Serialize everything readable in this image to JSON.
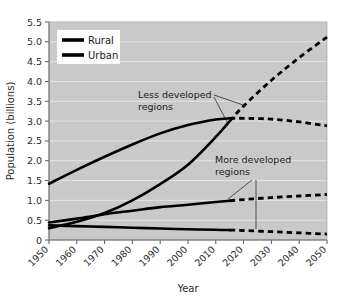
{
  "chart_data": {
    "type": "line",
    "title": "",
    "xlabel": "Year",
    "ylabel": "Population (billions)",
    "xlim": [
      1950,
      2050
    ],
    "ylim": [
      0,
      5.5
    ],
    "grid": true,
    "legend_position": "top-left",
    "x_ticks": [
      "1950",
      "1960",
      "1970",
      "1980",
      "1990",
      "2000",
      "2010",
      "2020",
      "2030",
      "2040",
      "2050"
    ],
    "y_ticks": [
      "0",
      "0.5",
      "1.0",
      "1.5",
      "2.0",
      "2.5",
      "3.0",
      "3.5",
      "4.0",
      "4.5",
      "5.0",
      "5.5"
    ],
    "legend": [
      {
        "label": "Rural",
        "style": "solid",
        "color": "#000000"
      },
      {
        "label": "Urban",
        "style": "solid",
        "color": "#000000"
      }
    ],
    "annotations": [
      {
        "id": "less-developed",
        "text_line1": "Less developed",
        "text_line2": "regions"
      },
      {
        "id": "more-developed",
        "text_line1": "More developed",
        "text_line2": "regions"
      }
    ],
    "projection_start_year": 2015,
    "series": [
      {
        "name": "Less developed regions - Rural",
        "region": "Less developed",
        "type": "Rural",
        "x": [
          1950,
          1960,
          1970,
          1980,
          1990,
          2000,
          2010,
          2015,
          2020,
          2030,
          2040,
          2050
        ],
        "values": [
          1.42,
          1.77,
          2.1,
          2.41,
          2.69,
          2.9,
          3.04,
          3.07,
          3.07,
          3.05,
          2.98,
          2.88
        ]
      },
      {
        "name": "Less developed regions - Urban",
        "region": "Less developed",
        "type": "Urban",
        "x": [
          1950,
          1960,
          1970,
          1980,
          1990,
          2000,
          2010,
          2015,
          2020,
          2030,
          2040,
          2050
        ],
        "values": [
          0.3,
          0.46,
          0.68,
          1.0,
          1.41,
          1.9,
          2.6,
          3.0,
          3.38,
          4.03,
          4.6,
          5.12
        ]
      },
      {
        "name": "More developed regions - Urban",
        "region": "More developed",
        "type": "Urban",
        "x": [
          1950,
          1960,
          1970,
          1980,
          1990,
          2000,
          2010,
          2015,
          2020,
          2030,
          2040,
          2050
        ],
        "values": [
          0.44,
          0.54,
          0.65,
          0.74,
          0.83,
          0.89,
          0.96,
          0.99,
          1.02,
          1.07,
          1.11,
          1.15
        ]
      },
      {
        "name": "More developed regions - Rural",
        "region": "More developed",
        "type": "Rural",
        "x": [
          1950,
          1960,
          1970,
          1980,
          1990,
          2000,
          2010,
          2015,
          2020,
          2030,
          2040,
          2050
        ],
        "values": [
          0.37,
          0.35,
          0.33,
          0.31,
          0.29,
          0.27,
          0.26,
          0.25,
          0.24,
          0.21,
          0.18,
          0.15
        ]
      }
    ]
  },
  "axes": {
    "y_title": "Population (billions)",
    "x_title": "Year"
  },
  "legend": {
    "rural_label": "Rural",
    "urban_label": "Urban"
  },
  "annotations": {
    "less_line1": "Less developed",
    "less_line2": "regions",
    "more_line1": "More developed",
    "more_line2": "regions"
  },
  "colors": {
    "plot_background": "#c9c9c9",
    "gridline": "#e4e4e4",
    "line": "#000000",
    "axis": "#555555",
    "page_background": "#ffffff"
  }
}
